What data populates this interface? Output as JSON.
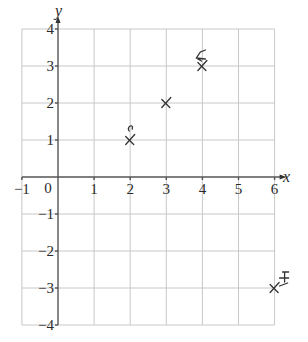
{
  "chart_data": {
    "type": "scatter",
    "title": "",
    "xlabel": "x",
    "ylabel": "y",
    "xlim": [
      -1,
      6
    ],
    "ylim": [
      -4,
      4
    ],
    "grid": true,
    "x_ticks": [
      -1,
      0,
      1,
      2,
      3,
      4,
      5,
      6
    ],
    "x_tick_labels": [
      "−1",
      "0",
      "1",
      "2",
      "3",
      "4",
      "5",
      "6"
    ],
    "y_ticks": [
      -4,
      -3,
      -2,
      -1,
      1,
      2,
      3,
      4
    ],
    "y_tick_labels": [
      "−4",
      "−3",
      "−2",
      "−1",
      "1",
      "2",
      "3",
      "4"
    ],
    "series": [
      {
        "name": "plotted points",
        "marker": "cross",
        "points": [
          {
            "x": 2,
            "y": 1
          },
          {
            "x": 3,
            "y": 2
          },
          {
            "x": 4,
            "y": 3
          },
          {
            "x": 6,
            "y": -3
          }
        ]
      }
    ],
    "annotations": [
      {
        "near": [
          2,
          1
        ],
        "description": "small hand-drawn scribble above point"
      },
      {
        "near": [
          4,
          3
        ],
        "description": "hand-drawn scribble above point"
      },
      {
        "near": [
          6,
          -3
        ],
        "description": "hand-drawn scribble above-right of point"
      }
    ],
    "colors": {
      "grid": "#c8c8c8",
      "axis": "#555555",
      "marker": "#333333"
    }
  }
}
